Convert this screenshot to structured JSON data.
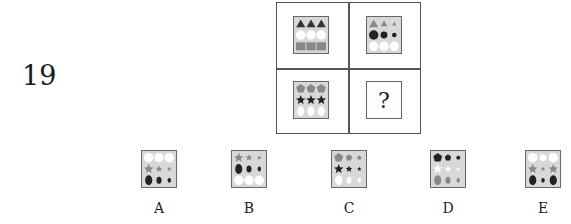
{
  "question": {
    "number": "19",
    "missing_symbol": "?"
  },
  "matrix": {
    "cells": [
      {
        "position": "top-left",
        "rows": [
          {
            "shape": "triangle",
            "color": "#333333",
            "sizes": [
              "large",
              "large",
              "large"
            ]
          },
          {
            "shape": "circle",
            "color": "#ffffff",
            "sizes": [
              "large",
              "large",
              "large"
            ]
          },
          {
            "shape": "square",
            "color": "#888888",
            "sizes": [
              "large",
              "large",
              "large"
            ]
          }
        ]
      },
      {
        "position": "top-right",
        "rows": [
          {
            "shape": "triangle",
            "color": "#888888",
            "sizes": [
              "large",
              "medium",
              "small"
            ]
          },
          {
            "shape": "circle",
            "color": "#222222",
            "sizes": [
              "large",
              "medium",
              "small"
            ]
          },
          {
            "shape": "circle",
            "color": "#ffffff",
            "sizes": [
              "large",
              "large",
              "large"
            ]
          }
        ]
      },
      {
        "position": "bottom-left",
        "rows": [
          {
            "shape": "pentagon",
            "color": "#888888",
            "sizes": [
              "large",
              "large",
              "large"
            ]
          },
          {
            "shape": "star",
            "color": "#222222",
            "sizes": [
              "large",
              "large",
              "large"
            ]
          },
          {
            "shape": "oval",
            "color": "#ffffff",
            "sizes": [
              "large",
              "large",
              "large"
            ]
          }
        ]
      }
    ]
  },
  "options": [
    {
      "label": "A",
      "rows": [
        {
          "shape": "circle",
          "color": "#ffffff",
          "sizes": [
            "large",
            "large",
            "large"
          ]
        },
        {
          "shape": "star",
          "color": "#888888",
          "sizes": [
            "large",
            "medium",
            "small"
          ]
        },
        {
          "shape": "oval",
          "color": "#222222",
          "sizes": [
            "large",
            "medium",
            "small"
          ]
        }
      ]
    },
    {
      "label": "B",
      "rows": [
        {
          "shape": "star",
          "color": "#888888",
          "sizes": [
            "large",
            "medium",
            "small"
          ]
        },
        {
          "shape": "oval",
          "color": "#222222",
          "sizes": [
            "large",
            "medium",
            "small"
          ]
        },
        {
          "shape": "circle",
          "color": "#ffffff",
          "sizes": [
            "large",
            "large",
            "large"
          ]
        }
      ]
    },
    {
      "label": "C",
      "rows": [
        {
          "shape": "pentagon",
          "color": "#888888",
          "sizes": [
            "large",
            "medium",
            "small"
          ]
        },
        {
          "shape": "star",
          "color": "#222222",
          "sizes": [
            "large",
            "medium",
            "small"
          ]
        },
        {
          "shape": "oval",
          "color": "#ffffff",
          "sizes": [
            "large",
            "medium",
            "small"
          ]
        }
      ]
    },
    {
      "label": "D",
      "rows": [
        {
          "shape": "pentagon",
          "color": "#222222",
          "sizes": [
            "large",
            "medium",
            "small"
          ]
        },
        {
          "shape": "star",
          "color": "#ffffff",
          "sizes": [
            "large",
            "medium",
            "small"
          ]
        },
        {
          "shape": "oval",
          "color": "#888888",
          "sizes": [
            "large",
            "medium",
            "small"
          ]
        }
      ]
    },
    {
      "label": "E",
      "rows": [
        {
          "shape": "circle",
          "color": "#ffffff",
          "sizes": [
            "large",
            "medium",
            "large"
          ]
        },
        {
          "shape": "star",
          "color": "#888888",
          "sizes": [
            "large",
            "small",
            "large"
          ]
        },
        {
          "shape": "oval",
          "color": "#222222",
          "sizes": [
            "large",
            "small",
            "large"
          ]
        }
      ]
    }
  ]
}
